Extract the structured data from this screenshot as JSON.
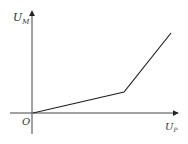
{
  "diagram": {
    "type": "piecewise-linear graph",
    "y_axis": {
      "label": "U",
      "subscript": "M"
    },
    "x_axis": {
      "label": "U",
      "subscript": "P"
    },
    "origin_label": "O",
    "colors": {
      "axis": "#444444",
      "line": "#222222",
      "text": "#333333",
      "background": "#ffffff"
    },
    "segments": [
      {
        "from": "origin",
        "to": "knee",
        "slope": "shallow"
      },
      {
        "from": "knee",
        "to": "end",
        "slope": "steep"
      }
    ]
  }
}
